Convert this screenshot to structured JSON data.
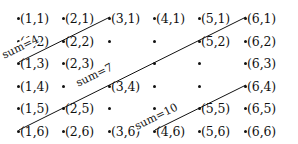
{
  "figure": {
    "background_color": "#ffffff",
    "ink_color": "#111111",
    "width": 298,
    "height": 144
  },
  "grid": {
    "rows": 6,
    "cols": 6,
    "col_x": [
      19,
      64,
      110,
      155,
      200,
      246
    ],
    "row_y": [
      17,
      40,
      62,
      85,
      107,
      130
    ],
    "cells": [
      {
        "i": 1,
        "j": 1,
        "label": "(1,1)",
        "show_label": true
      },
      {
        "i": 2,
        "j": 1,
        "label": "(2,1)",
        "show_label": true
      },
      {
        "i": 3,
        "j": 1,
        "label": "(3,1)",
        "show_label": true
      },
      {
        "i": 4,
        "j": 1,
        "label": "(4,1)",
        "show_label": true
      },
      {
        "i": 5,
        "j": 1,
        "label": "(5,1)",
        "show_label": true
      },
      {
        "i": 6,
        "j": 1,
        "label": "(6,1)",
        "show_label": true
      },
      {
        "i": 1,
        "j": 2,
        "label": "(1,2)",
        "show_label": true
      },
      {
        "i": 2,
        "j": 2,
        "label": "(2,2)",
        "show_label": true
      },
      {
        "i": 3,
        "j": 2,
        "label": "(3,2)",
        "show_label": false
      },
      {
        "i": 4,
        "j": 2,
        "label": "(4,2)",
        "show_label": false
      },
      {
        "i": 5,
        "j": 2,
        "label": "(5,2)",
        "show_label": true
      },
      {
        "i": 6,
        "j": 2,
        "label": "(6,2)",
        "show_label": true
      },
      {
        "i": 1,
        "j": 3,
        "label": "(1,3)",
        "show_label": true
      },
      {
        "i": 2,
        "j": 3,
        "label": "(2,3)",
        "show_label": true
      },
      {
        "i": 3,
        "j": 3,
        "label": "(3,3)",
        "show_label": false
      },
      {
        "i": 4,
        "j": 3,
        "label": "(4,3)",
        "show_label": false
      },
      {
        "i": 5,
        "j": 3,
        "label": "(5,3)",
        "show_label": false
      },
      {
        "i": 6,
        "j": 3,
        "label": "(6,3)",
        "show_label": true
      },
      {
        "i": 1,
        "j": 4,
        "label": "(1,4)",
        "show_label": true
      },
      {
        "i": 2,
        "j": 4,
        "label": "(2,4)",
        "show_label": false
      },
      {
        "i": 3,
        "j": 4,
        "label": "(3,4)",
        "show_label": true
      },
      {
        "i": 4,
        "j": 4,
        "label": "(4,4)",
        "show_label": false
      },
      {
        "i": 5,
        "j": 4,
        "label": "(5,4)",
        "show_label": false
      },
      {
        "i": 6,
        "j": 4,
        "label": "(6,4)",
        "show_label": true
      },
      {
        "i": 1,
        "j": 5,
        "label": "(1,5)",
        "show_label": true
      },
      {
        "i": 2,
        "j": 5,
        "label": "(2,5)",
        "show_label": true
      },
      {
        "i": 3,
        "j": 5,
        "label": "(3,5)",
        "show_label": false
      },
      {
        "i": 4,
        "j": 5,
        "label": "(4,5)",
        "show_label": false
      },
      {
        "i": 5,
        "j": 5,
        "label": "(5,5)",
        "show_label": true
      },
      {
        "i": 6,
        "j": 5,
        "label": "(6,5)",
        "show_label": true
      },
      {
        "i": 1,
        "j": 6,
        "label": "(1,6)",
        "show_label": true
      },
      {
        "i": 2,
        "j": 6,
        "label": "(2,6)",
        "show_label": true
      },
      {
        "i": 3,
        "j": 6,
        "label": "(3,6)",
        "show_label": true
      },
      {
        "i": 4,
        "j": 6,
        "label": "(4,6)",
        "show_label": true
      },
      {
        "i": 5,
        "j": 6,
        "label": "(5,6)",
        "show_label": true
      },
      {
        "i": 6,
        "j": 6,
        "label": "(6,6)",
        "show_label": true
      }
    ]
  },
  "diagonals": [
    {
      "name": "sum-4",
      "label": "sum=4",
      "sum": 4,
      "from": {
        "i": 1,
        "j": 3
      },
      "to": {
        "i": 3,
        "j": 1
      },
      "label_anchor": {
        "x": 39,
        "y": 38
      },
      "label_rotation_deg": -26
    },
    {
      "name": "sum-7",
      "label": "sum=7",
      "sum": 7,
      "from": {
        "i": 1,
        "j": 6
      },
      "to": {
        "i": 6,
        "j": 1
      },
      "label_anchor": {
        "x": 113,
        "y": 66
      },
      "label_rotation_deg": -26
    },
    {
      "name": "sum-10",
      "label": "sum=10",
      "sum": 10,
      "from": {
        "i": 4,
        "j": 6
      },
      "to": {
        "i": 6,
        "j": 4
      },
      "label_anchor": {
        "x": 178,
        "y": 106
      },
      "label_rotation_deg": -26
    }
  ]
}
